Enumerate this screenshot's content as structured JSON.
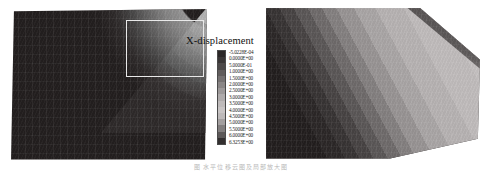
{
  "figure": {
    "caption": "图 水平位移云图及局部放大图"
  },
  "legend": {
    "title": "X-displacement",
    "colorbar_colors": [
      "#2b2727",
      "#3a3636",
      "#4d4949",
      "#615d5d",
      "#767272",
      "#8a8686",
      "#9d9999",
      "#afabab",
      "#bebaba",
      "#c8c4c4",
      "#bdb9b9",
      "#a39f9f",
      "#827e7e",
      "#5c5858",
      "#332f2f"
    ],
    "ticks": [
      "-5.0228E-04",
      "0.0000E+00",
      "5.0000E-01",
      "1.0000E+00",
      "1.5000E+00",
      "2.0000E+00",
      "2.5000E+00",
      "3.0000E+00",
      "3.5000E+00",
      "4.0000E+00",
      "4.5000E+00",
      "5.0000E+00",
      "5.5000E+00",
      "6.0000E+00",
      "6.3253E+00"
    ]
  },
  "chart_data": {
    "type": "heatmap",
    "title": "X-displacement",
    "subtitle": "",
    "xlabel": "",
    "ylabel": "",
    "colormap": "grayscale",
    "grid": false,
    "legend_position": "center",
    "units": "m",
    "value_range": [
      -0.00050228,
      6.3253
    ],
    "contour_levels": [
      -0.00050228,
      0.0,
      0.5,
      1.0,
      1.5,
      2.0,
      2.5,
      3.0,
      3.5,
      4.0,
      4.5,
      5.0,
      5.5,
      6.0,
      6.3253
    ],
    "tick_labels": [
      "-5.0228E-04",
      "0.0000E+00",
      "5.0000E-01",
      "1.0000E+00",
      "1.5000E+00",
      "2.0000E+00",
      "2.5000E+00",
      "3.0000E+00",
      "3.5000E+00",
      "4.0000E+00",
      "4.5000E+00",
      "5.0000E+00",
      "5.5000E+00",
      "6.0000E+00",
      "6.3253E+00"
    ],
    "panels": [
      {
        "name": "overview",
        "position": "left",
        "description": "Full slope mesh cross-section, parallelogram domain. Low displacement (dark) over most of the body; a curved high-displacement lobe in the upper-right corner marks the sliding mass / slip surface.",
        "has_zoom_marker": true
      },
      {
        "name": "detail",
        "position": "right",
        "description": "Magnified view of the boxed region. Diagonal contour bands increase from dark (low X-displacement) at the lower-left to light (maximum X-displacement) at the upper-right.",
        "has_zoom_marker": false
      }
    ]
  }
}
